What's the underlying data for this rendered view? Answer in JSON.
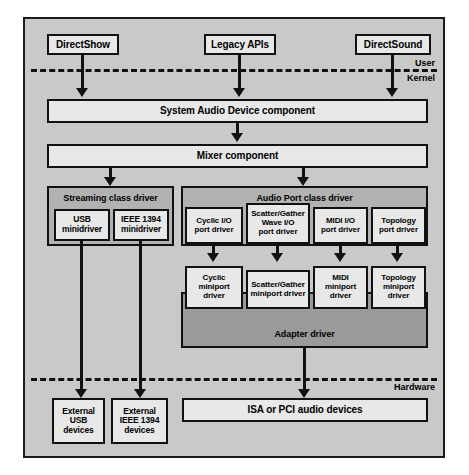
{
  "diagram": {
    "boundaries": [
      {
        "id": "user-kernel",
        "upper_label": "User",
        "lower_label": "Kernel"
      },
      {
        "id": "kernel-hardware",
        "upper_label": "",
        "lower_label": "Hardware"
      }
    ],
    "colors": {
      "frame_background": "#c9c9c9",
      "group_background": "#b2b2b2",
      "adapter_background": "#9a9a9a",
      "box_background": "#e8e8e8",
      "line": "#111111"
    },
    "user_mode_apis": [
      {
        "id": "directshow",
        "label": "DirectShow"
      },
      {
        "id": "legacy-apis",
        "label": "Legacy APIs"
      },
      {
        "id": "directsound",
        "label": "DirectSound"
      }
    ],
    "system_components": [
      {
        "id": "system-audio-device",
        "label": "System Audio Device component"
      },
      {
        "id": "mixer",
        "label": "Mixer component"
      }
    ],
    "streaming_class": {
      "label": "Streaming class driver",
      "minidrivers": [
        {
          "id": "usb-minidriver",
          "label": "USB\nminidriver"
        },
        {
          "id": "ieee1394-minidriver",
          "label": "IEEE 1394\nminidriver"
        }
      ]
    },
    "audio_port_class": {
      "label": "Audio Port class driver",
      "port_drivers": [
        {
          "id": "cyclic-port",
          "label": "Cyclic I/O\nport driver"
        },
        {
          "id": "scatter-gather-wave-port",
          "label": "Scatter/Gather\nWave I/O\nport driver"
        },
        {
          "id": "midi-port",
          "label": "MIDI I/O\nport driver"
        },
        {
          "id": "topology-port",
          "label": "Topology\nport driver"
        }
      ],
      "miniport_drivers": [
        {
          "id": "cyclic-miniport",
          "label": "Cyclic\nminiport\ndriver"
        },
        {
          "id": "scatter-gather-miniport",
          "label": "Scatter/Gather\nminiport driver"
        },
        {
          "id": "midi-miniport",
          "label": "MIDI\nminiport\ndriver"
        },
        {
          "id": "topology-miniport",
          "label": "Topology\nminiport\ndriver"
        }
      ],
      "adapter": {
        "id": "adapter-driver",
        "label": "Adapter driver"
      }
    },
    "hardware": [
      {
        "id": "external-usb-devices",
        "label": "External\nUSB\ndevices"
      },
      {
        "id": "external-ieee1394-devices",
        "label": "External\nIEEE 1394\ndevices"
      },
      {
        "id": "isa-pci-audio-devices",
        "label": "ISA or PCI audio devices"
      }
    ]
  }
}
